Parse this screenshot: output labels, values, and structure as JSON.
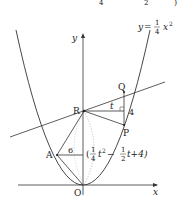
{
  "top_cropped_formula": {
    "frac1_den": "4",
    "frac2_den": "2",
    "close_paren": ")"
  },
  "curve_label": {
    "y": "y",
    "eq": "=",
    "num": "1",
    "den": "4",
    "x": "x",
    "exp": "2"
  },
  "axes": {
    "x_label": "x",
    "y_label": "y",
    "origin_label": "O"
  },
  "points": {
    "R": "R",
    "Q": "Q",
    "P": "P",
    "A": "A"
  },
  "segment_labels": {
    "t": "t",
    "four": "4",
    "six": "6"
  },
  "coord_label": {
    "open": "(",
    "frac1_num": "1",
    "frac1_den": "4",
    "t_sq": "t",
    "sq": "2",
    "minus": "−",
    "frac2_num": "1",
    "frac2_den": "2",
    "rest": "t+4)"
  },
  "colors": {
    "stroke": "#333333",
    "dotted": "#aaaaaa",
    "text": "#222222"
  }
}
